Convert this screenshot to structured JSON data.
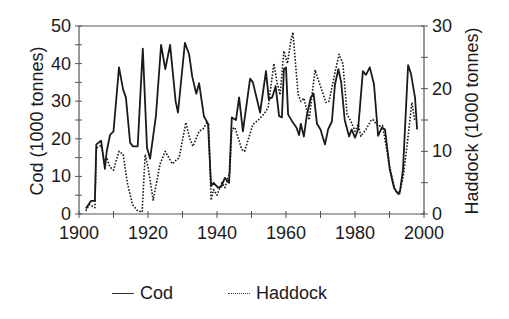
{
  "chart_data": {
    "type": "line",
    "title": "",
    "xlabel": "",
    "ylabel": "Cod (1000 tonnes)",
    "ylabel_right": "Haddock (1000 tonnes)",
    "xlim": [
      1900,
      2000
    ],
    "ylim": [
      0,
      50
    ],
    "ylim_right": [
      0,
      30
    ],
    "x_ticks": [
      "1900",
      "1920",
      "1940",
      "1960",
      "1980",
      "2000"
    ],
    "y_ticks": [
      "0",
      "10",
      "20",
      "30",
      "40",
      "50"
    ],
    "y_ticks_right": [
      "0",
      "10",
      "20",
      "30"
    ],
    "grid": false,
    "legend_position": "bottom",
    "series": [
      {
        "name": "Cod",
        "axis": "left",
        "style": "solid",
        "x": [
          1902,
          1903.5,
          1904.6,
          1905,
          1906.4,
          1907.5,
          1908,
          1909,
          1910,
          1911.6,
          1912.8,
          1913.6,
          1914.8,
          1915.6,
          1917,
          1918.5,
          1919.7,
          1920.6,
          1922.3,
          1923.8,
          1925,
          1926.4,
          1928,
          1928.7,
          1930.7,
          1931.9,
          1932.8,
          1934,
          1934.8,
          1936.2,
          1937.4,
          1938.3,
          1939,
          1940.3,
          1941.2,
          1942.3,
          1943.5,
          1944.3,
          1945.5,
          1946.4,
          1947.5,
          1949.6,
          1950.4,
          1952.5,
          1954.2,
          1955,
          1956,
          1957,
          1958,
          1958.8,
          1959.4,
          1960,
          1960.6,
          1962,
          1963,
          1963.8,
          1964.3,
          1965.2,
          1966,
          1967.2,
          1968,
          1969,
          1970,
          1971.3,
          1972.2,
          1973.3,
          1974.2,
          1975.2,
          1976,
          1977,
          1978.3,
          1979,
          1980,
          1980.9,
          1982.3,
          1983.2,
          1984.3,
          1985.5,
          1986.7,
          1987.8,
          1988.7,
          1990.1,
          1991.3,
          1992.2,
          1993,
          1993.9,
          1995.4,
          1996.2,
          1997.4,
          1998
        ],
        "values": [
          1.5,
          3.5,
          3.5,
          18.5,
          19.5,
          12,
          16.5,
          21,
          22,
          39,
          33,
          31,
          19,
          18,
          18,
          44,
          17.6,
          14.7,
          26,
          45,
          38.5,
          45,
          30,
          27,
          45.5,
          42.5,
          36.6,
          32,
          34.8,
          26,
          24,
          7.5,
          8.3,
          7,
          7.2,
          9.6,
          8.3,
          25.7,
          25,
          31,
          22,
          36,
          35,
          27,
          38,
          30.5,
          31,
          34,
          26,
          25.7,
          38.5,
          39,
          26.5,
          24.3,
          23,
          21,
          24,
          20.6,
          26,
          31,
          32,
          24,
          22.5,
          18.5,
          22.5,
          24.6,
          34.5,
          38.5,
          35,
          25,
          20.6,
          22.5,
          20.3,
          22.5,
          38,
          37,
          39,
          34.5,
          20.8,
          23,
          22.5,
          11.8,
          7,
          5.6,
          5.9,
          11.8,
          39.6,
          37.4,
          31,
          22.5
        ]
      },
      {
        "name": "Haddock",
        "axis": "right",
        "style": "dotted",
        "x": [
          1902,
          1903,
          1904.6,
          1905,
          1906.4,
          1907.5,
          1908,
          1909,
          1910,
          1911.6,
          1912.8,
          1914,
          1915.5,
          1917,
          1918.3,
          1919.2,
          1920,
          1921.5,
          1923.5,
          1925,
          1927,
          1929,
          1931,
          1932,
          1933,
          1934.8,
          1936,
          1937,
          1937.6,
          1938.3,
          1939,
          1940,
          1941.4,
          1942.3,
          1943.7,
          1944.3,
          1945.2,
          1947.2,
          1948,
          1950.4,
          1952,
          1953.7,
          1954.8,
          1956.5,
          1957.4,
          1958.3,
          1959.4,
          1960.4,
          1961.4,
          1962,
          1963.5,
          1964.3,
          1965.2,
          1966.7,
          1968.4,
          1969.3,
          1971.6,
          1972.5,
          1974.2,
          1975.4,
          1976.5,
          1977.7,
          1978.8,
          1980,
          1980.9,
          1981.7,
          1983.2,
          1984.6,
          1985.2,
          1986.7,
          1988,
          1989.9,
          1991.6,
          1992.8,
          1994,
          1995.3,
          1996.5,
          1997.3
        ],
        "values": [
          0.5,
          1.5,
          1,
          10.5,
          11,
          8,
          9,
          7.5,
          7,
          10,
          9.5,
          5,
          1.5,
          0.5,
          0.3,
          9.5,
          7.5,
          2.2,
          8,
          10,
          8,
          9,
          14.6,
          12.2,
          10.8,
          13.2,
          13.6,
          14.5,
          14.3,
          2.2,
          3.9,
          3,
          5,
          4.2,
          6.6,
          13.5,
          13.8,
          10.3,
          10,
          14.3,
          15,
          16,
          17,
          24,
          21,
          19,
          26,
          24,
          27.6,
          29,
          19.1,
          18,
          18.5,
          15,
          23,
          21.5,
          17.8,
          18,
          22.6,
          25.5,
          24,
          15.9,
          14.8,
          13.2,
          14.3,
          12.4,
          13.5,
          14.9,
          15.1,
          14,
          14.1,
          7.9,
          3.9,
          3,
          6,
          12,
          17.8,
          15
        ]
      }
    ]
  },
  "legend": {
    "items": [
      {
        "label": "Cod",
        "style": "solid"
      },
      {
        "label": "Haddock",
        "style": "dotted"
      }
    ]
  },
  "colors": {
    "line": "#1a1a1a",
    "axis": "#555555"
  }
}
